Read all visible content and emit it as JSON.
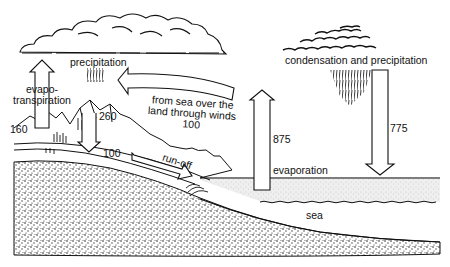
{
  "diagram": {
    "type": "water-cycle",
    "labels": {
      "precipitation": "precipitation",
      "evapotranspiration_line1": "evapo-",
      "evapotranspiration_line2": "transpiration",
      "winds_line1": "from sea over the",
      "winds_line2": "land through winds",
      "winds_value": "100",
      "condensation": "condensation and precipitation",
      "evaporation": "evaporation",
      "runoff": "run-off",
      "sea": "sea"
    },
    "values": {
      "evapotranspiration": "160",
      "land_precipitation": "260",
      "runoff": "100",
      "sea_evaporation": "875",
      "sea_precipitation": "775"
    },
    "colors": {
      "ink": "#111111",
      "background": "#ffffff",
      "sea_surface": "#e4e4e4",
      "ground": "#bdbdbd"
    }
  }
}
